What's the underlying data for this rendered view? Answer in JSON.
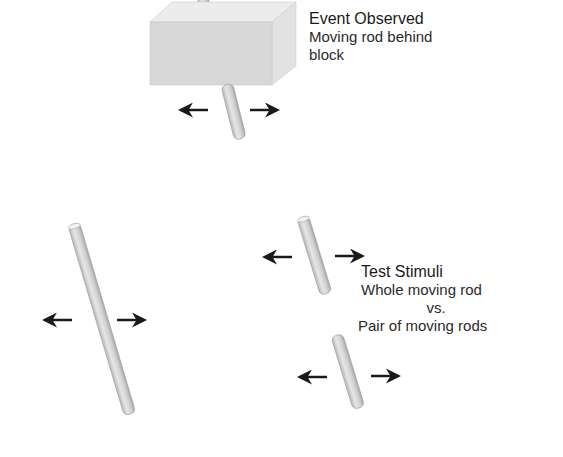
{
  "event_observed": {
    "title": "Event Observed",
    "description_line1": "Moving rod behind",
    "description_line2": "block"
  },
  "test_stimuli": {
    "title": "Test Stimuli",
    "line1": "Whole moving rod",
    "line2": "vs.",
    "line3": "Pair of moving rods"
  },
  "icons": {
    "arrow_left": "left-arrow",
    "arrow_right": "right-arrow"
  },
  "colors": {
    "background": "#ffffff",
    "block_front": "#d9d9d9",
    "block_top": "#ebebeb",
    "block_side": "#e4e4e4",
    "rod": "#d6d6d6",
    "arrow": "#1a1a1a",
    "text": "#222222"
  }
}
